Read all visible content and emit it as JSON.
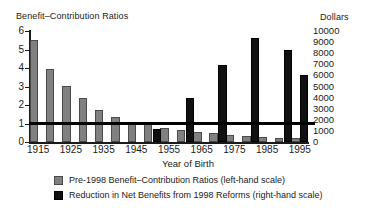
{
  "chart_data": {
    "type": "bar",
    "title": "",
    "xlabel": "Year of Birth",
    "left_axis_title": "Benefit–Contribution Ratios",
    "right_axis_title": "Dollars",
    "grid": false,
    "legend_position": "bottom-left",
    "x": [
      1915,
      1920,
      1925,
      1930,
      1935,
      1940,
      1945,
      1950,
      1955,
      1960,
      1965,
      1970,
      1975,
      1980,
      1985,
      1990,
      1995
    ],
    "xtick_labels": [
      "1915",
      "1925",
      "1935",
      "1945",
      "1955",
      "1965",
      "1975",
      "1985",
      "1995"
    ],
    "xtick_values": [
      1915,
      1925,
      1935,
      1945,
      1955,
      1965,
      1975,
      1985,
      1995
    ],
    "ylim_left": [
      0,
      6
    ],
    "ytick_labels_left": [
      "6",
      "5",
      "4",
      "3",
      "2",
      "1",
      "0"
    ],
    "ytick_values_left": [
      6,
      5,
      4,
      3,
      2,
      1,
      0
    ],
    "ylim_right": [
      0,
      10000
    ],
    "ytick_labels_right": [
      "10000",
      "9000",
      "8000",
      "7000",
      "6000",
      "5000",
      "4000",
      "3000",
      "2000",
      "1000",
      "0"
    ],
    "ytick_values_right": [
      10000,
      9000,
      8000,
      7000,
      6000,
      5000,
      4000,
      3000,
      2000,
      1000,
      0
    ],
    "reference_line": {
      "value": 1.0,
      "axis": "left",
      "label": ""
    },
    "series": [
      {
        "name": "Pre-1998 Benefit–Contribution Ratios (left-hand scale)",
        "axis": "left",
        "color": "#808080",
        "values": [
          5.5,
          3.95,
          3.05,
          2.4,
          1.75,
          1.35,
          1.05,
          0.95,
          0.75,
          0.65,
          0.55,
          0.5,
          0.4,
          0.33,
          0.27,
          0.22,
          0.2
        ]
      },
      {
        "name": "Reduction in Net Benefits from 1998 Reforms (right-hand scale)",
        "axis": "right",
        "color": "#111111",
        "values": [
          0,
          0,
          0,
          0,
          0,
          0,
          0,
          1150,
          0,
          3950,
          0,
          6900,
          0,
          9350,
          0,
          8250,
          6000
        ]
      }
    ]
  },
  "legend": {
    "items": [
      {
        "swatch": "gray",
        "label": "Pre-1998 Benefit–Contribution Ratios (left-hand scale)"
      },
      {
        "swatch": "black",
        "label": "Reduction in Net Benefits from 1998 Reforms (right-hand scale)"
      }
    ]
  }
}
